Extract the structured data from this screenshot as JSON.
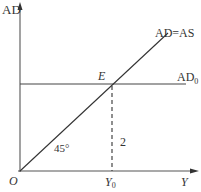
{
  "diagram": {
    "title": "",
    "y_axis_label": "AD",
    "x_axis_label": "Y",
    "origin_label": "O",
    "line_45_label": "AD=AS",
    "horizontal_line_label": "AD",
    "horizontal_line_subscript": "0",
    "intersection_label": "E",
    "x_marker_label": "Y",
    "x_marker_subscript": "0",
    "angle_label": "45°",
    "dashed_line_label": "2",
    "colors": {
      "line": "#333333",
      "axis": "#555555",
      "background": "#ffffff"
    }
  }
}
